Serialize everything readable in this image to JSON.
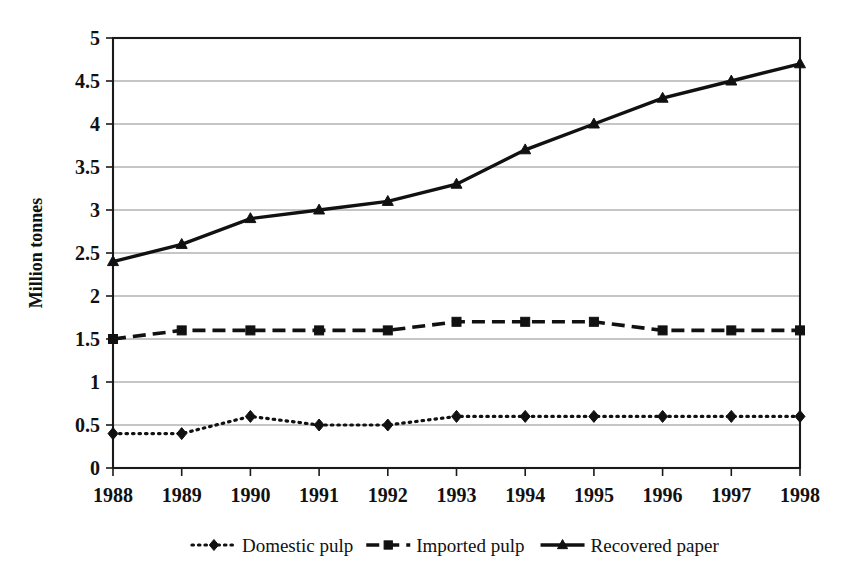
{
  "chart_data": {
    "type": "line",
    "title": "",
    "xlabel": "",
    "ylabel": "Million tonnes",
    "categories": [
      "1988",
      "1989",
      "1990",
      "1991",
      "1992",
      "1993",
      "1994",
      "1995",
      "1996",
      "1997",
      "1998"
    ],
    "x": [
      1988,
      1989,
      1990,
      1991,
      1992,
      1993,
      1994,
      1995,
      1996,
      1997,
      1998
    ],
    "ylim": [
      0,
      5
    ],
    "ytick_labels": [
      "0",
      "0.5",
      "1",
      "1.5",
      "2",
      "2.5",
      "3",
      "3.5",
      "4",
      "4.5",
      "5"
    ],
    "yticks": [
      0,
      0.5,
      1,
      1.5,
      2,
      2.5,
      3,
      3.5,
      4,
      4.5,
      5
    ],
    "grid": "horizontal",
    "legend_position": "bottom",
    "series": [
      {
        "name": "Domestic pulp",
        "marker": "diamond",
        "dash": "dotted",
        "color": "#111111",
        "values": [
          0.4,
          0.4,
          0.6,
          0.5,
          0.5,
          0.6,
          0.6,
          0.6,
          0.6,
          0.6,
          0.6
        ]
      },
      {
        "name": "Imported pulp",
        "marker": "square",
        "dash": "dashed",
        "color": "#111111",
        "values": [
          1.5,
          1.6,
          1.6,
          1.6,
          1.6,
          1.7,
          1.7,
          1.7,
          1.6,
          1.6,
          1.6
        ]
      },
      {
        "name": "Recovered paper",
        "marker": "triangle",
        "dash": "solid",
        "color": "#111111",
        "values": [
          2.4,
          2.6,
          2.9,
          3.0,
          3.1,
          3.3,
          3.7,
          4.0,
          4.3,
          4.5,
          4.7
        ]
      }
    ]
  },
  "axis": {
    "y_title": "Million tonnes"
  },
  "legend": {
    "items": [
      {
        "label": "Domestic pulp"
      },
      {
        "label": "Imported pulp"
      },
      {
        "label": "Recovered paper"
      }
    ]
  }
}
